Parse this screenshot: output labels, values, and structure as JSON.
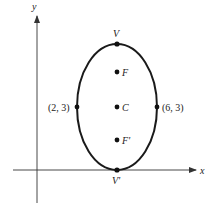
{
  "diagram": {
    "type": "ellipse-on-axes",
    "colors": {
      "stroke": "#1a1a1a",
      "axis": "#333333",
      "text": "#222222",
      "background": "#ffffff"
    },
    "axes": {
      "x_label": "x",
      "y_label": "y"
    },
    "ellipse": {
      "orientation": "vertical major axis",
      "center_label": "C",
      "top_vertex_label": "V",
      "bottom_vertex_label": "V'",
      "upper_focus_label": "F",
      "lower_focus_label": "F'",
      "left_point_label": "(2, 3)",
      "right_point_label": "(6, 3)"
    }
  }
}
